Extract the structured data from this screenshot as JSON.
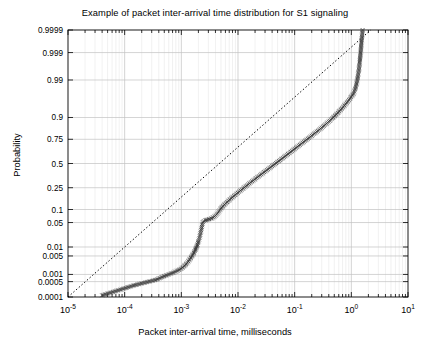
{
  "chart_data": {
    "type": "scatter",
    "title": "Example of packet inter-arrival time distribution for S1 signaling",
    "xlabel": "Packet inter-arrival time, milliseconds",
    "ylabel": "Probability",
    "xscale": "log",
    "yscale": "probability",
    "xlim": [
      1e-05,
      10
    ],
    "ylim": [
      0.0001,
      0.9999
    ],
    "grid": true,
    "legend": "none",
    "xticks": [
      {
        "value": 1e-05,
        "label": "10",
        "exp": "-5"
      },
      {
        "value": 0.0001,
        "label": "10",
        "exp": "-4"
      },
      {
        "value": 0.001,
        "label": "10",
        "exp": "-3"
      },
      {
        "value": 0.01,
        "label": "10",
        "exp": "-2"
      },
      {
        "value": 0.1,
        "label": "10",
        "exp": "-1"
      },
      {
        "value": 1,
        "label": "10",
        "exp": "0"
      },
      {
        "value": 10,
        "label": "10",
        "exp": "1"
      }
    ],
    "yticks": [
      {
        "value": 0.0001,
        "label": "0.0001"
      },
      {
        "value": 0.0005,
        "label": "0.0005"
      },
      {
        "value": 0.001,
        "label": "0.001"
      },
      {
        "value": 0.005,
        "label": "0.005"
      },
      {
        "value": 0.01,
        "label": "0.01"
      },
      {
        "value": 0.05,
        "label": "0.05"
      },
      {
        "value": 0.1,
        "label": "0.1"
      },
      {
        "value": 0.25,
        "label": "0.25"
      },
      {
        "value": 0.5,
        "label": "0.5"
      },
      {
        "value": 0.75,
        "label": "0.75"
      },
      {
        "value": 0.9,
        "label": "0.9"
      },
      {
        "value": 0.99,
        "label": "0.99"
      },
      {
        "value": 0.999,
        "label": "0.999"
      },
      {
        "value": 0.9999,
        "label": "0.9999"
      }
    ],
    "series": [
      {
        "name": "empirical-distribution",
        "marker": "x",
        "color": "#3a3a3a",
        "points": [
          [
            4e-05,
            0.00012
          ],
          [
            0.00015,
            0.00035
          ],
          [
            0.00036,
            0.0006
          ],
          [
            0.0005,
            0.00085
          ],
          [
            0.0007,
            0.00115
          ],
          [
            0.0009,
            0.0015
          ],
          [
            0.00105,
            0.00185
          ],
          [
            0.00115,
            0.00225
          ],
          [
            0.00125,
            0.0027
          ],
          [
            0.00133,
            0.0032
          ],
          [
            0.0014,
            0.00375
          ],
          [
            0.00147,
            0.0043
          ],
          [
            0.00153,
            0.0049
          ],
          [
            0.0016,
            0.0056
          ],
          [
            0.00166,
            0.0064
          ],
          [
            0.00172,
            0.0073
          ],
          [
            0.00178,
            0.0083
          ],
          [
            0.00183,
            0.0094
          ],
          [
            0.00188,
            0.0106
          ],
          [
            0.00193,
            0.012
          ],
          [
            0.00197,
            0.0135
          ],
          [
            0.00201,
            0.0152
          ],
          [
            0.00205,
            0.017
          ],
          [
            0.00209,
            0.019
          ],
          [
            0.00212,
            0.0212
          ],
          [
            0.00215,
            0.0236
          ],
          [
            0.00218,
            0.0262
          ],
          [
            0.00221,
            0.029
          ],
          [
            0.00224,
            0.032
          ],
          [
            0.00227,
            0.0353
          ],
          [
            0.0023,
            0.0388
          ],
          [
            0.00233,
            0.0426
          ],
          [
            0.00236,
            0.0466
          ],
          [
            0.0024,
            0.051
          ],
          [
            0.0025,
            0.054
          ],
          [
            0.00265,
            0.0565
          ],
          [
            0.00285,
            0.0585
          ],
          [
            0.0031,
            0.0605
          ],
          [
            0.0034,
            0.063
          ],
          [
            0.0037,
            0.067
          ],
          [
            0.004,
            0.073
          ],
          [
            0.0043,
            0.081
          ],
          [
            0.0046,
            0.091
          ],
          [
            0.0049,
            0.102
          ],
          [
            0.0053,
            0.114
          ],
          [
            0.0058,
            0.127
          ],
          [
            0.0064,
            0.141
          ],
          [
            0.0071,
            0.156
          ],
          [
            0.0079,
            0.172
          ],
          [
            0.0088,
            0.189
          ],
          [
            0.0099,
            0.207
          ],
          [
            0.0111,
            0.226
          ],
          [
            0.0125,
            0.246
          ],
          [
            0.0141,
            0.267
          ],
          [
            0.0159,
            0.289
          ],
          [
            0.0179,
            0.311
          ],
          [
            0.0202,
            0.334
          ],
          [
            0.0228,
            0.357
          ],
          [
            0.0257,
            0.381
          ],
          [
            0.029,
            0.405
          ],
          [
            0.0327,
            0.429
          ],
          [
            0.0369,
            0.454
          ],
          [
            0.0416,
            0.479
          ],
          [
            0.047,
            0.504
          ],
          [
            0.053,
            0.529
          ],
          [
            0.0598,
            0.554
          ],
          [
            0.0675,
            0.579
          ],
          [
            0.0762,
            0.604
          ],
          [
            0.086,
            0.628
          ],
          [
            0.097,
            0.652
          ],
          [
            0.109,
            0.675
          ],
          [
            0.123,
            0.698
          ],
          [
            0.139,
            0.72
          ],
          [
            0.157,
            0.741
          ],
          [
            0.177,
            0.761
          ],
          [
            0.2,
            0.781
          ],
          [
            0.226,
            0.8
          ],
          [
            0.255,
            0.818
          ],
          [
            0.288,
            0.835
          ],
          [
            0.325,
            0.852
          ],
          [
            0.367,
            0.868
          ],
          [
            0.414,
            0.883
          ],
          [
            0.467,
            0.897
          ],
          [
            0.527,
            0.911
          ],
          [
            0.595,
            0.924
          ],
          [
            0.671,
            0.936
          ],
          [
            0.757,
            0.947
          ],
          [
            0.854,
            0.957
          ],
          [
            0.964,
            0.966
          ],
          [
            1.09,
            0.974
          ],
          [
            1.17,
            0.981
          ],
          [
            1.24,
            0.987
          ],
          [
            1.3,
            0.992
          ],
          [
            1.36,
            0.9955
          ],
          [
            1.41,
            0.9978
          ],
          [
            1.46,
            0.999
          ],
          [
            1.52,
            0.9997
          ],
          [
            1.58,
            0.9999
          ]
        ]
      }
    ],
    "reference_line": {
      "name": "normal-reference-line",
      "style": "dotted",
      "color": "#000000",
      "from": [
        1e-05,
        0.0001
      ],
      "to": [
        2.2,
        0.9999
      ]
    }
  }
}
